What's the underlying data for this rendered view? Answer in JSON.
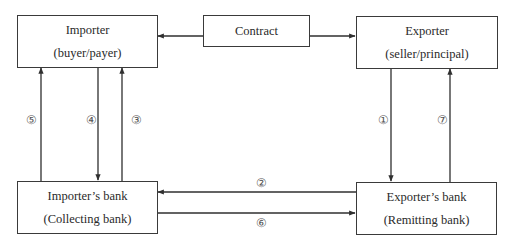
{
  "diagram": {
    "nodes": {
      "importer": {
        "line1": "Importer",
        "line2": "(buyer/payer)"
      },
      "contract": {
        "line1": "Contract"
      },
      "exporter": {
        "line1": "Exporter",
        "line2": "(seller/principal)"
      },
      "importers_bank": {
        "line1": "Importer’s bank",
        "line2": "(Collecting bank)"
      },
      "exporters_bank": {
        "line1": "Exporter’s bank",
        "line2": "(Remitting bank)"
      }
    },
    "edges": [
      {
        "id": "contract-to-importer",
        "from": "contract",
        "to": "importer",
        "label": ""
      },
      {
        "id": "contract-to-exporter",
        "from": "contract",
        "to": "exporter",
        "label": ""
      },
      {
        "id": "step1",
        "from": "exporter",
        "to": "exporters_bank",
        "label": "①"
      },
      {
        "id": "step2",
        "from": "exporters_bank",
        "to": "importers_bank",
        "label": "②"
      },
      {
        "id": "step3",
        "from": "importers_bank",
        "to": "importer",
        "label": "③"
      },
      {
        "id": "step4",
        "from": "importer",
        "to": "importers_bank",
        "label": "④"
      },
      {
        "id": "step5",
        "from": "importers_bank",
        "to": "importer",
        "label": "⑤"
      },
      {
        "id": "step6",
        "from": "importers_bank",
        "to": "exporters_bank",
        "label": "⑥"
      },
      {
        "id": "step7",
        "from": "exporters_bank",
        "to": "exporter",
        "label": "⑦"
      }
    ],
    "colors": {
      "line": "#2f2f2f",
      "border": "#3a3a3a",
      "text": "#2a2a2a",
      "label": "#555555"
    }
  }
}
